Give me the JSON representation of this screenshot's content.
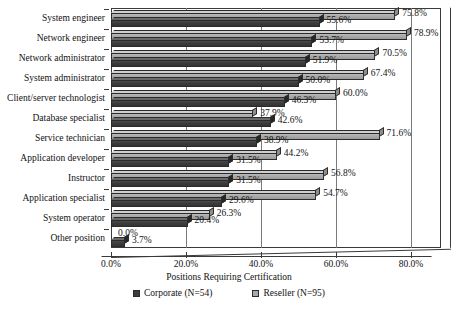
{
  "chart_data": {
    "type": "bar",
    "orientation": "horizontal",
    "title": "",
    "xlabel": "Positions Requiring Certification",
    "ylabel": "",
    "xlim": [
      0,
      88
    ],
    "xticks": [
      "0.0%",
      "20.0%",
      "40.0%",
      "60.0%",
      "80.0%"
    ],
    "xtick_values": [
      0,
      20,
      40,
      60,
      80
    ],
    "grid": true,
    "grid_axis": "x",
    "legend_position": "bottom",
    "categories": [
      "System engineer",
      "Network engineer",
      "Network administrator",
      "System administrator",
      "Client/server technologist",
      "Database specialist",
      "Service technician",
      "Application developer",
      "Instructor",
      "Application specialist",
      "System operator",
      "Other position"
    ],
    "series": [
      {
        "name": "Reseller (N=95)",
        "color": "#a9a9a9",
        "values": [
          75.8,
          78.9,
          70.5,
          67.4,
          60.0,
          37.9,
          71.6,
          44.2,
          56.8,
          54.7,
          26.3,
          0.0
        ],
        "labels": [
          "75.8%",
          "78.9%",
          "70.5%",
          "67.4%",
          "60.0%",
          "37.9%",
          "71.6%",
          "44.2%",
          "56.8%",
          "54.7%",
          "26.3%",
          "0.0%"
        ]
      },
      {
        "name": "Corporate (N=54)",
        "color": "#3c3c3c",
        "values": [
          55.6,
          53.7,
          51.9,
          50.0,
          46.3,
          42.6,
          38.9,
          31.5,
          31.5,
          29.6,
          20.4,
          3.7
        ],
        "labels": [
          "55.6%",
          "53.7%",
          "51.9%",
          "50.0%",
          "46.3%",
          "42.6%",
          "38.9%",
          "31.5%",
          "31.5%",
          "29.6%",
          "20.4%",
          "3.7%"
        ]
      }
    ]
  },
  "legend": {
    "items": [
      {
        "label": "Corporate (N=54)",
        "color": "#3c3c3c"
      },
      {
        "label": "Reseller (N=95)",
        "color": "#a9a9a9"
      }
    ]
  },
  "axis": {
    "x_title": "Positions Requiring Certification"
  }
}
